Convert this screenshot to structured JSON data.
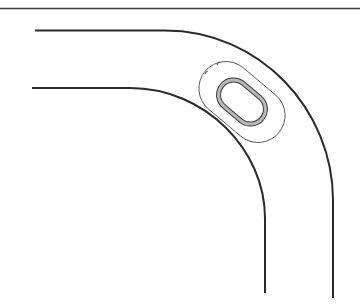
{
  "diagram": {
    "colors": {
      "background": "#ffffff",
      "stroke": "#2a2a2a",
      "thin_stroke": "#555555",
      "slot_band": "#b8b8b8"
    },
    "elements": [
      {
        "id": "top-border",
        "type": "line"
      },
      {
        "id": "outer-curve",
        "type": "path"
      },
      {
        "id": "inner-curve",
        "type": "path"
      },
      {
        "id": "slot-outline",
        "type": "rounded-slot"
      },
      {
        "id": "slot-hole",
        "type": "rounded-slot-double"
      },
      {
        "id": "tick-marks",
        "type": "marks",
        "count": 2
      }
    ]
  }
}
